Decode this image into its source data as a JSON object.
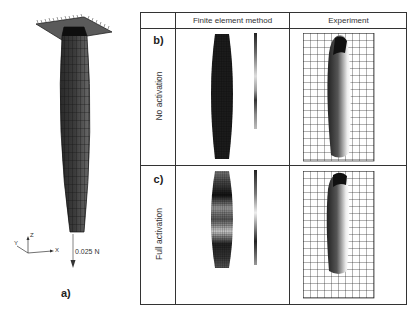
{
  "figure": {
    "panel_a": {
      "letter": "a)",
      "force_label": "0.025 N",
      "axes": {
        "x": "X",
        "y": "Y",
        "z": "Z"
      }
    },
    "table": {
      "columns": [
        "",
        "Finite element method",
        "Experiment"
      ],
      "rows": [
        {
          "letter": "b)",
          "label": "No activation",
          "fem_colorbar_ticks": 13
        },
        {
          "letter": "c)",
          "label": "Full activation",
          "fem_colorbar_ticks": 15
        }
      ]
    },
    "colors": {
      "border": "#333333",
      "mesh_dark": "#1a1a1a",
      "mesh_mid": "#555555",
      "grid_line": "#222222"
    }
  }
}
